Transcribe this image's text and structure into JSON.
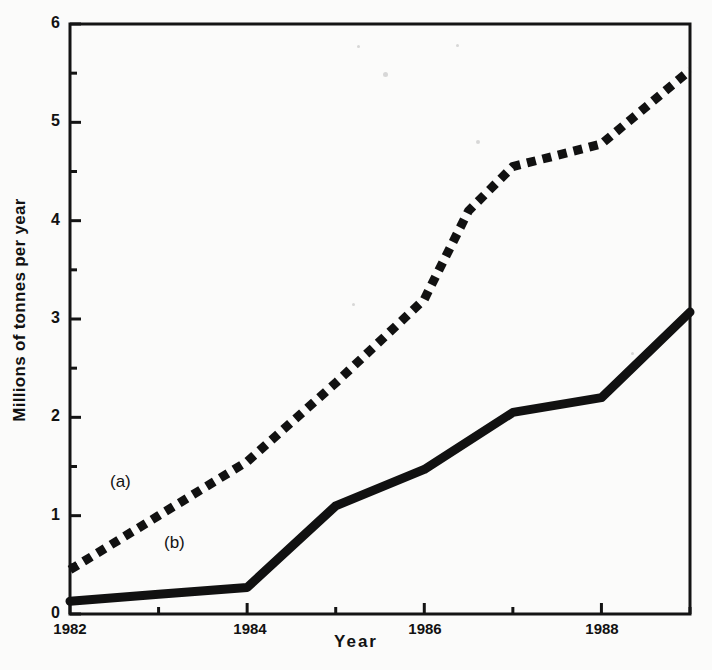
{
  "chart_data": {
    "type": "line",
    "title": "",
    "xlabel": "Year",
    "ylabel": "Millions of tonnes per year",
    "xlim": [
      1982,
      1989
    ],
    "ylim": [
      0,
      6
    ],
    "x": [
      1982,
      1983,
      1984,
      1985,
      1986,
      1987,
      1988,
      1989
    ],
    "xticks": [
      1982,
      1983,
      1984,
      1985,
      1986,
      1987,
      1988,
      1989
    ],
    "xtick_labels": [
      "1982",
      "",
      "1984",
      "",
      "1986",
      "",
      "1988",
      ""
    ],
    "yticks": [
      0,
      0.5,
      1,
      1.5,
      2,
      2.5,
      3,
      3.5,
      4,
      4.5,
      5,
      5.5,
      6
    ],
    "ytick_labels": [
      "0",
      "",
      "1",
      "",
      "2",
      "",
      "3",
      "",
      "4",
      "",
      "5",
      "",
      "6"
    ],
    "grid": false,
    "legend_position": "inline-annotations",
    "series": [
      {
        "name": "(a)",
        "style": "dotted",
        "color": "#111111",
        "annotation": "(a)",
        "values": [
          0.45,
          1.0,
          1.55,
          2.35,
          3.2,
          4.1,
          4.55,
          4.78,
          5.53
        ],
        "x": [
          1982,
          1983,
          1984,
          1985,
          1986,
          1986.5,
          1987,
          1988,
          1989
        ]
      },
      {
        "name": "(b)",
        "style": "solid",
        "color": "#111111",
        "annotation": "(b)",
        "values": [
          0.13,
          0.2,
          0.27,
          1.1,
          1.47,
          2.05,
          2.2,
          3.07
        ],
        "x": [
          1982,
          1983,
          1984,
          1985,
          1986,
          1987,
          1988,
          1989
        ]
      }
    ]
  },
  "axes": {
    "y_title": "Millions of tonnes per year",
    "x_title": "Year",
    "y_major_labels": [
      "0",
      "1",
      "2",
      "3",
      "4",
      "5",
      "6"
    ],
    "x_major_labels": [
      "1982",
      "1984",
      "1986",
      "1988"
    ]
  },
  "annotations": {
    "series_a": "(a)",
    "series_b": "(b)"
  },
  "colors": {
    "ink": "#111111",
    "background": "#fbfbfa",
    "axis": "#141414"
  }
}
